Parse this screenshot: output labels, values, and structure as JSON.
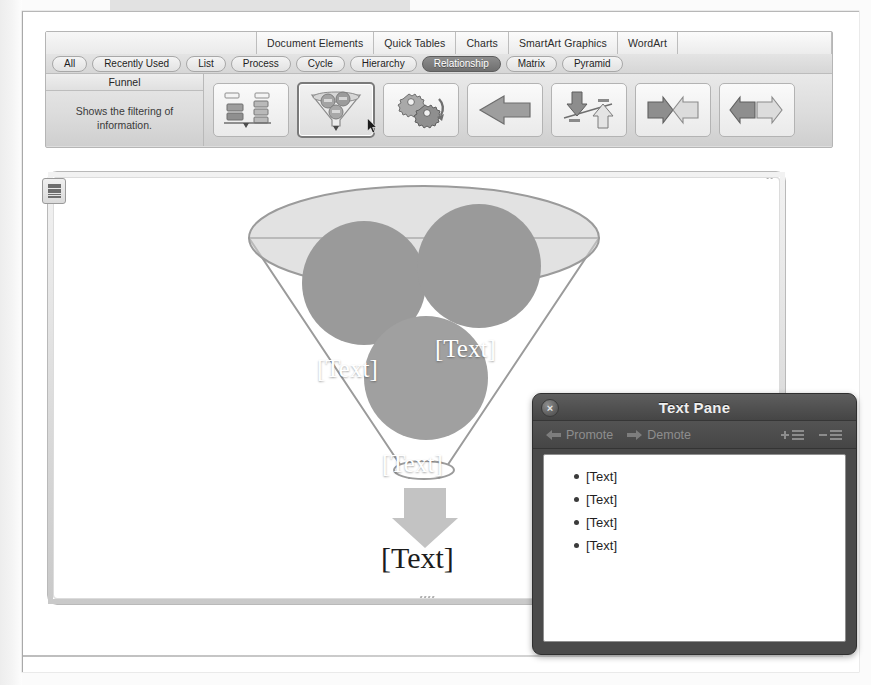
{
  "ribbon": {
    "tabs": [
      {
        "label": ""
      },
      {
        "label": "Document Elements"
      },
      {
        "label": "Quick Tables"
      },
      {
        "label": "Charts"
      },
      {
        "label": "SmartArt Graphics"
      },
      {
        "label": "WordArt"
      },
      {
        "label": ""
      }
    ],
    "categories": [
      {
        "label": "All",
        "selected": false
      },
      {
        "label": "Recently Used",
        "selected": false
      },
      {
        "label": "List",
        "selected": false
      },
      {
        "label": "Process",
        "selected": false
      },
      {
        "label": "Cycle",
        "selected": false
      },
      {
        "label": "Hierarchy",
        "selected": false
      },
      {
        "label": "Relationship",
        "selected": true
      },
      {
        "label": "Matrix",
        "selected": false
      },
      {
        "label": "Pyramid",
        "selected": false
      }
    ],
    "info": {
      "title": "Funnel",
      "description": "Shows the filtering of information."
    },
    "thumbnails": [
      {
        "name": "balance-layout",
        "selected": false
      },
      {
        "name": "funnel-layout",
        "selected": true
      },
      {
        "name": "gear-layout",
        "selected": false
      },
      {
        "name": "arrow-left-layout",
        "selected": false
      },
      {
        "name": "reverse-arrows-layout",
        "selected": false
      },
      {
        "name": "converging-arrows-layout",
        "selected": false
      },
      {
        "name": "diverging-arrows-layout",
        "selected": false
      }
    ]
  },
  "canvas": {
    "bubbles": [
      {
        "label": "[Text]"
      },
      {
        "label": "[Text]"
      },
      {
        "label": "[Text]"
      }
    ],
    "output_label": "[Text]",
    "colors": {
      "bubble_fill": "#9a9a9a",
      "funnel_stroke": "#9b9b9b",
      "ellipse_fill": "#c9c9c9",
      "arrow_fill": "#bdbdbd"
    }
  },
  "text_pane": {
    "title": "Text Pane",
    "close_label": "×",
    "toolbar": {
      "promote": "Promote",
      "demote": "Demote"
    },
    "items": [
      {
        "label": "[Text]"
      },
      {
        "label": "[Text]"
      },
      {
        "label": "[Text]"
      },
      {
        "label": "[Text]"
      }
    ]
  }
}
